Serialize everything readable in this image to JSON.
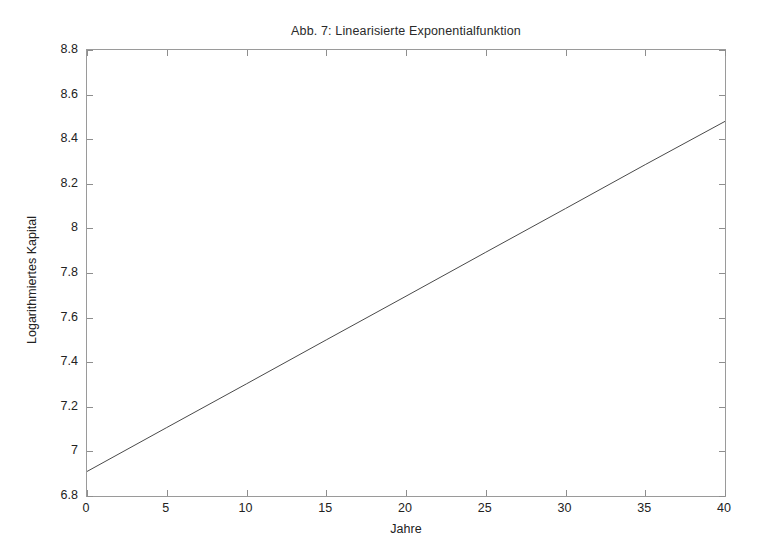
{
  "figure": {
    "background_color": "#ffffff",
    "frame_color": "#9a9a9a",
    "line_color": "#4a4a4a"
  },
  "chart_data": {
    "type": "line",
    "title": "Abb. 7: Linearisierte Exponentialfunktion",
    "xlabel": "Jahre",
    "ylabel": "Logarithmiertes Kapital",
    "xlim": [
      0,
      40
    ],
    "ylim": [
      6.8,
      8.8
    ],
    "xticks": [
      0,
      5,
      10,
      15,
      20,
      25,
      30,
      35,
      40
    ],
    "xtick_labels": [
      "0",
      "5",
      "10",
      "15",
      "20",
      "25",
      "30",
      "35",
      "40"
    ],
    "yticks": [
      6.8,
      7.0,
      7.2,
      7.4,
      7.6,
      7.8,
      8.0,
      8.2,
      8.4,
      8.6,
      8.8
    ],
    "ytick_labels": [
      "6.8",
      "7",
      "7.2",
      "7.4",
      "7.6",
      "7.8",
      "8",
      "8.2",
      "8.4",
      "8.6",
      "8.8"
    ],
    "grid": false,
    "legend": false,
    "series": [
      {
        "name": "Logarithmiertes Kapital",
        "color": "#4a4a4a",
        "line_width": 1,
        "x": [
          0,
          5,
          10,
          15,
          20,
          25,
          30,
          35,
          40
        ],
        "values": [
          6.91,
          7.107,
          7.303,
          7.5,
          7.696,
          7.893,
          8.089,
          8.286,
          8.48
        ]
      }
    ],
    "annotations": []
  }
}
